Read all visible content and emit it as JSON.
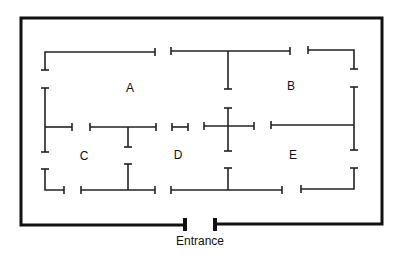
{
  "diagram": {
    "type": "floor-plan maze",
    "rooms": [
      {
        "id": "A",
        "label": "A",
        "x": 130,
        "y": 88
      },
      {
        "id": "B",
        "label": "B",
        "x": 291,
        "y": 86
      },
      {
        "id": "C",
        "label": "C",
        "x": 84,
        "y": 156
      },
      {
        "id": "D",
        "label": "D",
        "x": 178,
        "y": 155
      },
      {
        "id": "E",
        "label": "E",
        "x": 293,
        "y": 155
      }
    ],
    "entrance": {
      "label": "Entrance",
      "x": 200,
      "y": 234
    },
    "colors": {
      "line": "#111111",
      "background": "#ffffff"
    }
  }
}
